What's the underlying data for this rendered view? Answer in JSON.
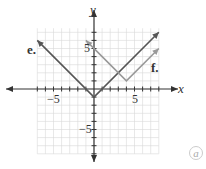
{
  "chart_data": {
    "type": "line",
    "title": "",
    "xlabel": "x",
    "ylabel": "y",
    "xlim": [
      -7.5,
      8
    ],
    "ylim": [
      -8,
      8
    ],
    "grid": true,
    "x_ticks_labeled": [
      -5,
      5
    ],
    "y_ticks_labeled": [
      5,
      -5
    ],
    "series": [
      {
        "name": "e.",
        "equation": "y = |x| - 1",
        "vertex": [
          0,
          -1
        ],
        "points": [
          [
            -7,
            6
          ],
          [
            0,
            -1
          ],
          [
            8,
            7
          ]
        ],
        "color": "#555555"
      },
      {
        "name": "f.",
        "equation": "y = |x - 4| + 1",
        "vertex": [
          4,
          1
        ],
        "points": [
          [
            -1,
            6
          ],
          [
            4,
            1
          ],
          [
            8,
            5
          ]
        ],
        "color": "#999999"
      }
    ]
  },
  "labels": {
    "x_axis": "x",
    "y_axis": "y",
    "tick_neg5_x": "−5",
    "tick_5_x": "5",
    "tick_5_y": "5",
    "tick_neg5_y": "−5",
    "series_e": "e.",
    "series_f": "f.",
    "corner_mark": "a"
  }
}
